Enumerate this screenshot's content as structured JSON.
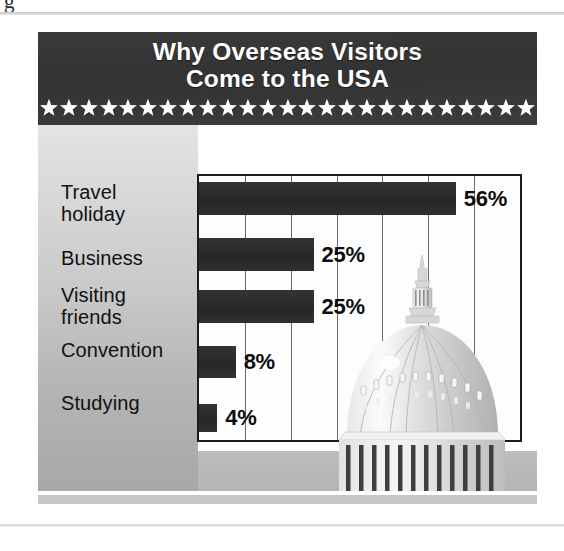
{
  "document": {
    "corner_glyph": "g",
    "top_rule": "horizontal-rule",
    "bottom_rule": "horizontal-rule"
  },
  "infographic": {
    "title_line1": "Why Overseas Visitors",
    "title_line2": "Come to the USA",
    "title_full": "Why Overseas Visitors\nCome to the USA",
    "star_count": 25,
    "star_icon": "star-icon",
    "illustration": "us-capitol-dome-illustration",
    "colors": {
      "header_background": "#383838",
      "header_text": "#ffffff",
      "bar_fill": "#2e2e2e",
      "plot_background": "#fdfdfd",
      "plot_border": "#1c1c1c",
      "gridline": "#6b6b6b",
      "label_panel_light": "#e4e4e4",
      "label_panel_dark": "#adadad",
      "value_text": "#0d0d0d"
    }
  },
  "chart_data": {
    "type": "bar",
    "orientation": "horizontal",
    "title": "Why Overseas Visitors Come to the USA",
    "xlabel": "",
    "ylabel": "",
    "xlim": [
      0,
      70
    ],
    "grid": true,
    "grid_interval": 10,
    "gridline_count": 7,
    "legend": "none",
    "unit": "%",
    "categories": [
      "Travel\nholiday",
      "Business",
      "Visiting\nfriends",
      "Convention",
      "Studying"
    ],
    "values": [
      56,
      25,
      25,
      8,
      4
    ],
    "labels": [
      "56%",
      "25%",
      "25%",
      "8%",
      "4%"
    ]
  }
}
